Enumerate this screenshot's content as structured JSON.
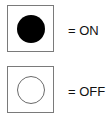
{
  "legend": {
    "items": [
      {
        "state": "on",
        "symbol": "filled-circle",
        "symbol_color": "#000000",
        "label": "= ON"
      },
      {
        "state": "off",
        "symbol": "empty-circle",
        "symbol_color": "#ffffff",
        "label": "= OFF"
      }
    ],
    "box_border_color": "#7a7a7a"
  }
}
